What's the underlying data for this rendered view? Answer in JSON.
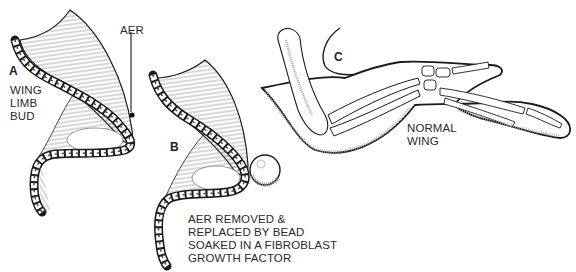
{
  "figure": {
    "panels": [
      {
        "id": "A",
        "letter": "A",
        "caption_lines": [
          "WING",
          "LIMB",
          "BUD"
        ],
        "pointer_label": "AER"
      },
      {
        "id": "B",
        "letter": "B",
        "caption_lines": [
          "AER REMOVED &",
          "REPLACED BY BEAD",
          "SOAKED IN A FIBROBLAST",
          "GROWTH FACTOR"
        ]
      },
      {
        "id": "C",
        "letter": "C",
        "caption_lines": [
          "NORMAL",
          "WING"
        ]
      }
    ],
    "colors": {
      "ink": "#1a1a1a",
      "hatch": "#6a6a6a",
      "background": "#ffffff"
    }
  }
}
